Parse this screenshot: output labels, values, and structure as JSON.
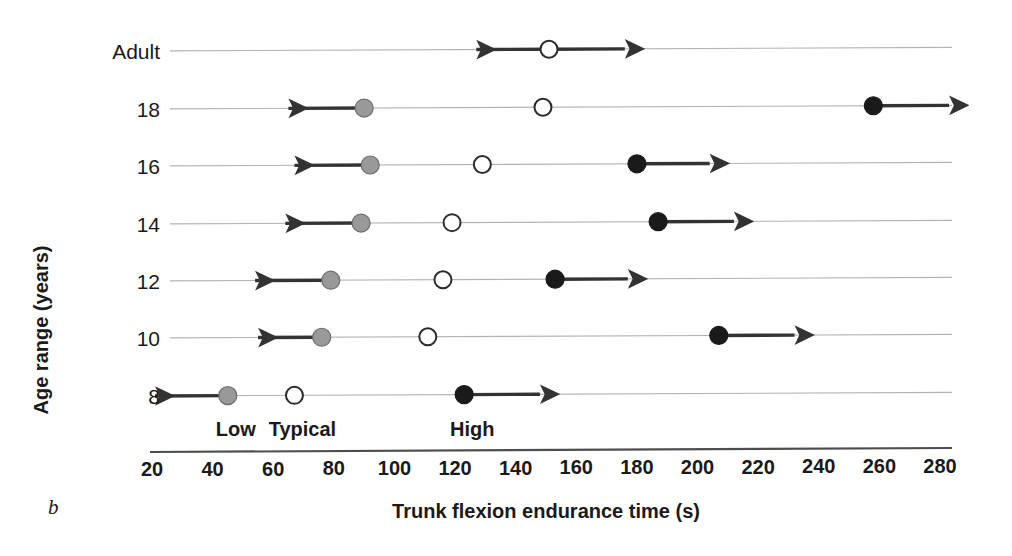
{
  "chart_data": {
    "type": "scatter",
    "title": "",
    "panel_letter": "b",
    "xlabel": "Trunk flexion endurance time (s)",
    "ylabel": "Age range (years)",
    "xlim": [
      20,
      280
    ],
    "xticks": [
      20,
      40,
      60,
      80,
      100,
      120,
      140,
      160,
      180,
      200,
      220,
      240,
      260,
      280
    ],
    "xtick_labels": [
      "20",
      "40",
      "60",
      "80",
      "100",
      "120",
      "140",
      "160",
      "180",
      "200",
      "220",
      "240",
      "260",
      "280"
    ],
    "categories": [
      "Adult",
      "18",
      "16",
      "14",
      "12",
      "10",
      "8"
    ],
    "grid": true,
    "legend_position": "inline-bottom",
    "category_labels": [
      {
        "name": "Low",
        "value": 45,
        "marker": "gray-filled-circle",
        "color": "#8c8c8c"
      },
      {
        "name": "Typical",
        "value": 67,
        "marker": "white-open-circle",
        "color": "#ffffff"
      },
      {
        "name": "High",
        "value": 123,
        "marker": "black-filled-circle",
        "color": "#1a1a1a"
      }
    ],
    "series": [
      {
        "name": "Low",
        "marker": "gray-filled-circle",
        "color": "#999999",
        "arrow": "left",
        "points": [
          {
            "category": "Adult",
            "value": null,
            "arrow_to": null
          },
          {
            "category": "18",
            "value": 90,
            "arrow_to": 65
          },
          {
            "category": "16",
            "value": 92,
            "arrow_to": 67
          },
          {
            "category": "14",
            "value": 89,
            "arrow_to": 64
          },
          {
            "category": "12",
            "value": 79,
            "arrow_to": 54
          },
          {
            "category": "10",
            "value": 76,
            "arrow_to": 55
          },
          {
            "category": "8",
            "value": 45,
            "arrow_to": 21
          }
        ]
      },
      {
        "name": "Typical",
        "marker": "white-open-circle",
        "color": "#ffffff",
        "arrow": "both-adult-only",
        "points": [
          {
            "category": "Adult",
            "value": 151,
            "arrow_from": 127,
            "arrow_to": 176
          },
          {
            "category": "18",
            "value": 149,
            "arrow_from": null,
            "arrow_to": null
          },
          {
            "category": "16",
            "value": 129,
            "arrow_from": null,
            "arrow_to": null
          },
          {
            "category": "14",
            "value": 119,
            "arrow_from": null,
            "arrow_to": null
          },
          {
            "category": "12",
            "value": 116,
            "arrow_from": null,
            "arrow_to": null
          },
          {
            "category": "10",
            "value": 111,
            "arrow_from": null,
            "arrow_to": null
          },
          {
            "category": "8",
            "value": 67,
            "arrow_from": null,
            "arrow_to": null
          }
        ]
      },
      {
        "name": "High",
        "marker": "black-filled-circle",
        "color": "#1a1a1a",
        "arrow": "right",
        "points": [
          {
            "category": "Adult",
            "value": null,
            "arrow_to": null
          },
          {
            "category": "18",
            "value": 258,
            "arrow_to": 283
          },
          {
            "category": "16",
            "value": 180,
            "arrow_to": 204
          },
          {
            "category": "14",
            "value": 187,
            "arrow_to": 212
          },
          {
            "category": "12",
            "value": 153,
            "arrow_to": 177
          },
          {
            "category": "10",
            "value": 207,
            "arrow_to": 232
          },
          {
            "category": "8",
            "value": 123,
            "arrow_to": 148
          }
        ]
      }
    ],
    "colors": {
      "low": "#999999",
      "typical": "#ffffff",
      "high": "#1a1a1a",
      "gridline": "#b3b3b3",
      "axis": "#4d4d4d",
      "text": "#1a1a1a"
    }
  }
}
